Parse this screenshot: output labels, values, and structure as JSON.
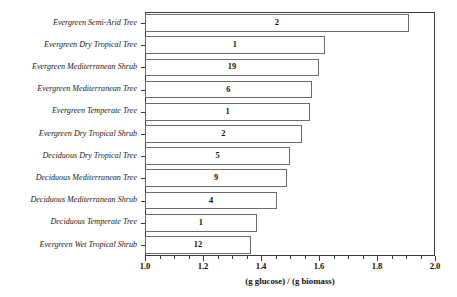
{
  "chart_data": {
    "type": "bar",
    "orientation": "horizontal",
    "title": "",
    "subtitle": "",
    "xlabel": "(g glucose) / (g biomass)",
    "ylabel": "",
    "xlim": [
      1.0,
      2.0
    ],
    "xticks": [
      "1.0",
      "1.2",
      "1.4",
      "1.6",
      "1.8",
      "2.0"
    ],
    "xtick_values": [
      1.0,
      1.2,
      1.4,
      1.6,
      1.8,
      2.0
    ],
    "minor_tick_interval": 0.05,
    "grid": false,
    "legend": "none",
    "bar_label_note": "number inside each bar is the sample count (n)",
    "categories": [
      "Evergreen Semi-Arid Tree",
      "Evergreen Dry Tropical Tree",
      "Evergreen Mediterranean Shrub",
      "Evergreen Mediterranean Tree",
      "Evergreen Temperate Tree",
      "Evergreen Dry Tropical Shrub",
      "Deciduous Dry Tropical Tree",
      "Deciduous Mediterranean Tree",
      "Deciduous Mediterranean Shrub",
      "Deciduous Temperate Tree",
      "Evergreen Wet Tropical Shrub"
    ],
    "values": [
      1.91,
      1.62,
      1.6,
      1.575,
      1.57,
      1.54,
      1.5,
      1.49,
      1.455,
      1.385,
      1.365
    ],
    "counts": [
      2,
      1,
      19,
      6,
      1,
      2,
      5,
      9,
      4,
      1,
      12
    ]
  },
  "style": {
    "axis_color": "#3a3a3a",
    "bar_edge_color": "#6a6a6a",
    "bar_fill_color": "#ffffff",
    "text_color": "#111111",
    "background": "#ffffff"
  }
}
